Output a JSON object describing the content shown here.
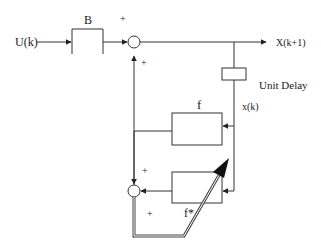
{
  "diagram": {
    "type": "block-diagram",
    "input_label": "U(k)",
    "output_label": "X(k+1)",
    "blocks": {
      "B": {
        "label": "B"
      },
      "unit_delay": {
        "label": "Unit Delay"
      },
      "f": {
        "label": "f"
      },
      "f_star": {
        "label": "f*"
      }
    },
    "state_label": "x(k)",
    "summing_junctions": {
      "top": {
        "signs": [
          "+",
          "+"
        ]
      },
      "bottom": {
        "signs": [
          "+",
          "+"
        ]
      }
    },
    "colors": {
      "line": "#333333",
      "background": "#ffffff"
    }
  }
}
